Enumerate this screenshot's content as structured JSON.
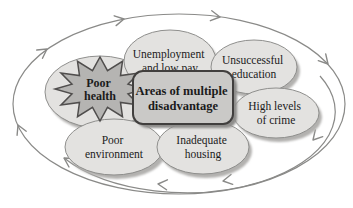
{
  "center": {
    "line1": "Areas of multiple",
    "line2": "disadvantage"
  },
  "nodes": {
    "health": {
      "line1": "Poor",
      "line2": "health"
    },
    "unemployment": {
      "line1": "Unemployment",
      "line2": "and low pay"
    },
    "education": {
      "line1": "Unsuccessful",
      "line2": "education"
    },
    "crime": {
      "line1": "High levels",
      "line2": "of crime"
    },
    "environment": {
      "line1": "Poor",
      "line2": "environment"
    },
    "housing": {
      "line1": "Inadequate",
      "line2": "housing"
    }
  },
  "colors": {
    "background": "#ffffff",
    "node_fill": "#e3e2e0",
    "node_stroke": "#8f8f8d",
    "node_shadow": "#b2b1af",
    "center_fill": "#cac9c7",
    "center_stroke": "#413f3e",
    "center_shadow": "#8e8d8b",
    "burst_fill": "#b5b4b2",
    "burst_stroke": "#504e4d",
    "arrow": "#8a8a88",
    "text": "#1b1b1b"
  }
}
